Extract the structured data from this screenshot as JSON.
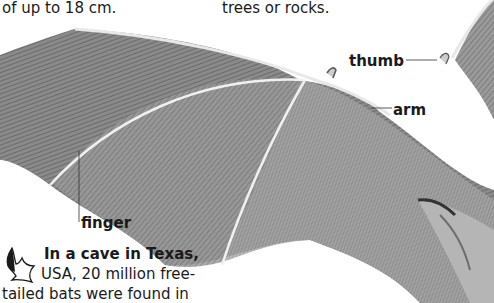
{
  "top_text": {
    "left_fragment": "of up to 18 cm.",
    "right_fragment": "trees or rocks."
  },
  "illustration": {
    "subject": "bat wing",
    "labels": {
      "thumb": "thumb",
      "arm": "arm",
      "finger": "finger"
    }
  },
  "fact": {
    "icon": "bat-icon",
    "heading": "In a cave in Texas,",
    "line2": "USA, 20 million free-",
    "line3": "tailed bats were found in"
  }
}
